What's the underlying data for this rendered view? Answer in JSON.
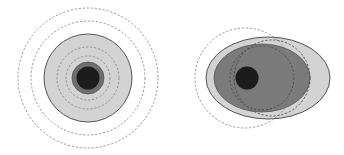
{
  "diagram": {
    "width": 344,
    "height": 155,
    "colors": {
      "background": "#ffffff",
      "light_fill": "#d3d3d3",
      "mid_fill": "#7a7a7a",
      "dark_fill": "#1c1c1c",
      "ring_fill": "#6e6e6e",
      "outline": "#555555",
      "dashed": "#8a8a8a"
    },
    "left_figure": {
      "description": "concentric circles",
      "center": [
        88,
        78
      ],
      "dashed_radii": [
        70,
        57,
        31,
        22
      ],
      "light_disc_radius": 44,
      "ring_radius": 16,
      "core_radius": 11.5
    },
    "right_figure": {
      "description": "offset ellipses",
      "outer_ellipse": {
        "cx": 268,
        "cy": 78,
        "rx": 62,
        "ry": 41
      },
      "inner_ellipse": {
        "cx": 262,
        "cy": 78,
        "rx": 48,
        "ry": 34
      },
      "core": {
        "cx": 247,
        "cy": 78,
        "r": 11.5
      },
      "dashed_circle": {
        "cx": 245,
        "cy": 78,
        "r": 50
      },
      "dashed_arcs": [
        {
          "cx": 262,
          "cy": 78,
          "r": 32
        },
        {
          "cx": 272,
          "cy": 78,
          "r": 38
        }
      ]
    }
  }
}
